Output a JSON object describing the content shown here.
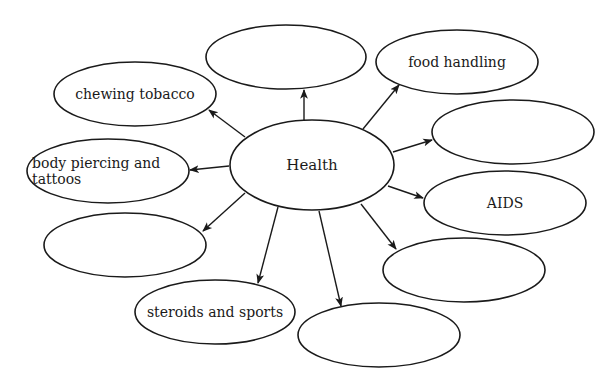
{
  "diagram": {
    "type": "concept-web",
    "center": {
      "id": "health",
      "label": "Health",
      "cx": 312,
      "cy": 165,
      "rx": 82,
      "ry": 45
    },
    "nodes": [
      {
        "id": "top",
        "lines": [
          ""
        ],
        "cx": 286,
        "cy": 57,
        "rx": 80,
        "ry": 32,
        "arrow": {
          "x1": 304,
          "y1": 120,
          "x2": 304,
          "y2": 90
        }
      },
      {
        "id": "food-handling",
        "lines": [
          "food handling"
        ],
        "cx": 457,
        "cy": 62,
        "rx": 81,
        "ry": 32,
        "arrow": {
          "x1": 363,
          "y1": 129,
          "x2": 399,
          "y2": 85
        }
      },
      {
        "id": "right-upper",
        "lines": [
          ""
        ],
        "cx": 513,
        "cy": 132,
        "rx": 81,
        "ry": 32,
        "arrow": {
          "x1": 393,
          "y1": 152,
          "x2": 432,
          "y2": 140
        }
      },
      {
        "id": "aids",
        "lines": [
          "AIDS"
        ],
        "cx": 505,
        "cy": 203,
        "rx": 81,
        "ry": 32,
        "arrow": {
          "x1": 388,
          "y1": 186,
          "x2": 423,
          "y2": 198
        }
      },
      {
        "id": "right-lower",
        "lines": [
          ""
        ],
        "cx": 464,
        "cy": 270,
        "rx": 81,
        "ry": 32,
        "arrow": {
          "x1": 361,
          "y1": 204,
          "x2": 396,
          "y2": 249
        }
      },
      {
        "id": "bottom",
        "lines": [
          ""
        ],
        "cx": 379,
        "cy": 335,
        "rx": 81,
        "ry": 32,
        "arrow": {
          "x1": 319,
          "y1": 211,
          "x2": 341,
          "y2": 306
        }
      },
      {
        "id": "steroids-and-sports",
        "lines": [
          "steroids and sports"
        ],
        "cx": 215,
        "cy": 312,
        "rx": 80,
        "ry": 32,
        "arrow": {
          "x1": 278,
          "y1": 207,
          "x2": 258,
          "y2": 283
        }
      },
      {
        "id": "left-lower",
        "lines": [
          ""
        ],
        "cx": 125,
        "cy": 245,
        "rx": 81,
        "ry": 32,
        "arrow": {
          "x1": 245,
          "y1": 193,
          "x2": 203,
          "y2": 231
        }
      },
      {
        "id": "body-piercing-and-tattoos",
        "lines": [
          "body piercing and",
          "tattoos"
        ],
        "cx": 108,
        "cy": 171,
        "rx": 81,
        "ry": 32,
        "text_anchor": "start",
        "text_x": 32,
        "arrow": {
          "x1": 229,
          "y1": 166,
          "x2": 190,
          "y2": 170
        }
      },
      {
        "id": "chewing-tobacco",
        "lines": [
          "chewing tobacco"
        ],
        "cx": 135,
        "cy": 94,
        "rx": 81,
        "ry": 32,
        "arrow": {
          "x1": 245,
          "y1": 137,
          "x2": 209,
          "y2": 110
        }
      }
    ],
    "colors": {
      "stroke": "#1a1a1a",
      "text": "#1a1a1a",
      "background": "#ffffff"
    }
  }
}
